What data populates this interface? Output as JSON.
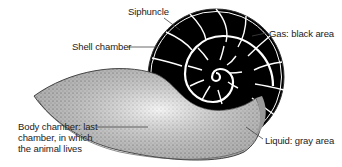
{
  "diagram": {
    "labels": {
      "siphuncle": "Siphuncle",
      "shell_chamber": "Shell chamber",
      "gas": "Gas: black area",
      "body_chamber_line1": "Body chamber: last",
      "body_chamber_line2": "chamber, in which",
      "body_chamber_line3": "the animal lives",
      "liquid": "Liquid: gray area"
    },
    "colors": {
      "gas_fill": "#000000",
      "liquid_body_fill": "#bdbdbd",
      "septa": "#ffffff",
      "leader": "#444444",
      "text": "#222222"
    }
  }
}
